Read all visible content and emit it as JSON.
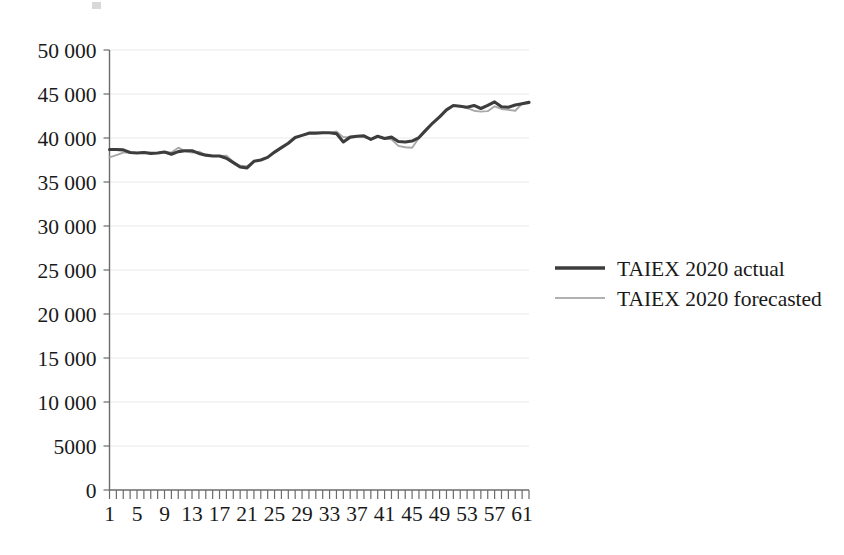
{
  "chart_data": {
    "type": "line",
    "title": "",
    "xlabel": "",
    "ylabel": "",
    "ylim": [
      0,
      50000
    ],
    "xlim": [
      1,
      62
    ],
    "grid": true,
    "legend_position": "right",
    "ytick_labels": [
      "50 000",
      "45 000",
      "40 000",
      "35 000",
      "30 000",
      "25 000",
      "20 000",
      "15 000",
      "10 000",
      "5000",
      "0"
    ],
    "ytick_values": [
      50000,
      45000,
      40000,
      35000,
      30000,
      25000,
      20000,
      15000,
      10000,
      5000,
      0
    ],
    "xtick_labels": [
      "1",
      "5",
      "9",
      "13",
      "17",
      "21",
      "25",
      "29",
      "33",
      "37",
      "41",
      "45",
      "49",
      "53",
      "57",
      "61"
    ],
    "xtick_values": [
      1,
      5,
      9,
      13,
      17,
      21,
      25,
      29,
      33,
      37,
      41,
      45,
      49,
      53,
      57,
      61
    ],
    "x": [
      1,
      2,
      3,
      4,
      5,
      6,
      7,
      8,
      9,
      10,
      11,
      12,
      13,
      14,
      15,
      16,
      17,
      18,
      19,
      20,
      21,
      22,
      23,
      24,
      25,
      26,
      27,
      28,
      29,
      30,
      31,
      32,
      33,
      34,
      35,
      36,
      37,
      38,
      39,
      40,
      41,
      42,
      43,
      44,
      45,
      46,
      47,
      48,
      49,
      50,
      51,
      52,
      53,
      54,
      55,
      56,
      57,
      58,
      59,
      60,
      61,
      62
    ],
    "series": [
      {
        "name": "TAIEX 2020 actual",
        "color": "#3d3d3d",
        "values": [
          38700,
          38700,
          38650,
          38350,
          38300,
          38350,
          38250,
          38300,
          38400,
          38150,
          38450,
          38550,
          38550,
          38250,
          38050,
          37950,
          37950,
          37700,
          37200,
          36700,
          36600,
          37350,
          37500,
          37800,
          38400,
          38900,
          39400,
          40050,
          40300,
          40550,
          40550,
          40600,
          40600,
          40500,
          39550,
          40100,
          40200,
          40250,
          39850,
          40200,
          39950,
          40100,
          39600,
          39550,
          39650,
          40050,
          40900,
          41700,
          42400,
          43200,
          43700,
          43600,
          43500,
          43700,
          43350,
          43700,
          44100,
          43550,
          43500,
          43750,
          43900,
          44050
        ]
      },
      {
        "name": "TAIEX 2020 forecasted",
        "color": "#a8a8a8",
        "values": [
          37800,
          38050,
          38350,
          38350,
          38300,
          38350,
          38250,
          38300,
          38400,
          38350,
          38900,
          38500,
          38350,
          38450,
          38050,
          37950,
          37950,
          38000,
          37300,
          36850,
          36800,
          37350,
          37500,
          37850,
          38400,
          38900,
          39450,
          40050,
          40300,
          40550,
          40550,
          40600,
          40550,
          40750,
          40100,
          40100,
          40200,
          40100,
          39900,
          40150,
          39950,
          39850,
          39100,
          38950,
          38900,
          40000,
          40850,
          41700,
          42400,
          43250,
          43650,
          43600,
          43400,
          43100,
          43000,
          43050,
          43600,
          43300,
          43200,
          43100,
          43900,
          44100
        ]
      }
    ]
  },
  "legend": {
    "items": [
      {
        "label": "TAIEX 2020 actual",
        "color": "#3d3d3d"
      },
      {
        "label": "TAIEX 2020 forecasted",
        "color": "#a8a8a8"
      }
    ]
  }
}
